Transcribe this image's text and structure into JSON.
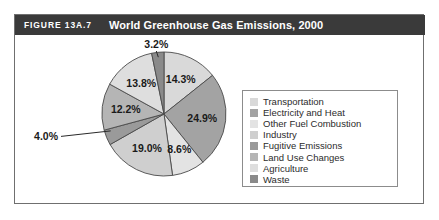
{
  "figure": {
    "number": "FIGURE 13A.7",
    "title": "World Greenhouse Gas Emissions, 2000",
    "header_bg": "#3a3a3a",
    "header_fg": "#ffffff",
    "frame_border": "#6f6f6f"
  },
  "legend": {
    "border_color": "#8c8c8c",
    "items": [
      {
        "label": "Transportation",
        "color": "#d9d9d9"
      },
      {
        "label": "Electricity and Heat",
        "color": "#a3a3a3"
      },
      {
        "label": "Other Fuel Combustion",
        "color": "#e3e3e3"
      },
      {
        "label": "Industry",
        "color": "#cfcfcf"
      },
      {
        "label": "Fugitive Emissions",
        "color": "#9a9a9a"
      },
      {
        "label": "Land Use Changes",
        "color": "#b5b5b5"
      },
      {
        "label": "Agriculture",
        "color": "#dedede"
      },
      {
        "label": "Waste",
        "color": "#8a8a8a"
      }
    ]
  },
  "chart_data": {
    "type": "pie",
    "title": "World Greenhouse Gas Emissions, 2000",
    "labels": [
      "Transportation",
      "Electricity and Heat",
      "Other Fuel Combustion",
      "Industry",
      "Fugitive Emissions",
      "Land Use Changes",
      "Agriculture",
      "Waste"
    ],
    "values": [
      14.3,
      24.9,
      8.6,
      19.0,
      4.0,
      12.2,
      13.8,
      3.2
    ],
    "value_labels": [
      "14.3%",
      "24.9%",
      "8.6%",
      "19.0%",
      "4.0%",
      "12.2%",
      "13.8%",
      "3.2%"
    ],
    "colors": [
      "#d9d9d9",
      "#a3a3a3",
      "#e3e3e3",
      "#cfcfcf",
      "#9a9a9a",
      "#b5b5b5",
      "#dedede",
      "#8a8a8a"
    ],
    "units": "percent",
    "start_angle_deg": 0,
    "direction": "clockwise",
    "legend_position": "right",
    "grid": false,
    "xlabel": "",
    "ylabel": "",
    "callout_labels": [
      "4.0%",
      "3.2%"
    ]
  }
}
